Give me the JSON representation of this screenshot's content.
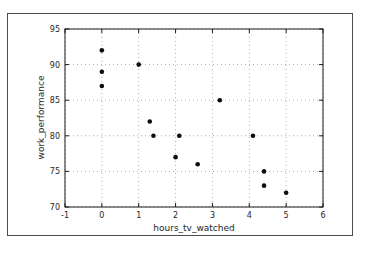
{
  "figure": {
    "frame_border_color": "#4d4d4d",
    "background_color": "#ffffff"
  },
  "chart_data": {
    "type": "scatter",
    "title": "",
    "xlabel": "hours_tv_watched",
    "ylabel": "work_performance",
    "xlim": [
      -1,
      6
    ],
    "ylim": [
      70,
      95
    ],
    "x_ticks": [
      -1,
      0,
      1,
      2,
      3,
      4,
      5,
      6
    ],
    "y_ticks": [
      70,
      75,
      80,
      85,
      90,
      95
    ],
    "grid": true,
    "grid_style": "dotted",
    "legend": false,
    "marker": "circle",
    "marker_color": "#0d0d0d",
    "points": [
      [
        0,
        92
      ],
      [
        0,
        89
      ],
      [
        0,
        87
      ],
      [
        1,
        90
      ],
      [
        1.3,
        82
      ],
      [
        1.4,
        80
      ],
      [
        2,
        77
      ],
      [
        2.1,
        80
      ],
      [
        2.6,
        76
      ],
      [
        3.2,
        85
      ],
      [
        4.1,
        80
      ],
      [
        4.4,
        75
      ],
      [
        4.4,
        73
      ],
      [
        5,
        72
      ]
    ]
  },
  "colors": {
    "spine": "#1a1a1a",
    "grid": "#b0b0b0",
    "tick": "#1a1a1a",
    "tick_label": "#262626",
    "background": "#ffffff"
  }
}
